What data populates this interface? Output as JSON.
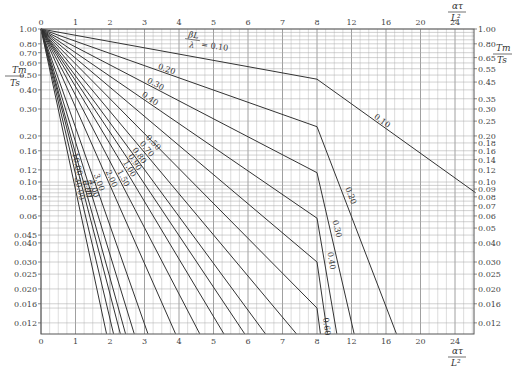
{
  "chart_data": {
    "type": "line",
    "title": "",
    "xlabel": "ατ / L²",
    "ylabel": "T_m / T_s",
    "x_scale": "piecewise-linear",
    "x_ticks": [
      0,
      1,
      2,
      3,
      4,
      5,
      6,
      7,
      8,
      12,
      16,
      20,
      24
    ],
    "x_tick_labels": [
      "0",
      "1",
      "2",
      "3",
      "4",
      "5",
      "6",
      "7",
      "8",
      "12",
      "16",
      "20",
      "24"
    ],
    "y_scale": "log",
    "ylim": [
      0.0102,
      1.0
    ],
    "y_ticks_left": [
      1.0,
      0.8,
      0.7,
      0.6,
      0.5,
      0.4,
      0.3,
      0.2,
      0.16,
      0.12,
      0.1,
      0.08,
      0.06,
      0.045,
      0.04,
      0.03,
      0.025,
      0.02,
      0.016,
      0.012
    ],
    "y_tick_labels_left": [
      "1.00",
      "0.80",
      "0.70",
      "0.60",
      "0.50",
      "0.40",
      "0.30",
      "0.20",
      "0.16",
      "0.12",
      "0.10",
      "0.08",
      "0.06",
      "0.045",
      "0.040",
      "0.030",
      "0.025",
      "0.020",
      "0.016",
      "0.012"
    ],
    "y_ticks_right": [
      1.0,
      0.8,
      0.65,
      0.55,
      0.45,
      0.35,
      0.3,
      0.25,
      0.2,
      0.18,
      0.16,
      0.14,
      0.12,
      0.1,
      0.09,
      0.08,
      0.07,
      0.06,
      0.05,
      0.04,
      0.03,
      0.025,
      0.02,
      0.016,
      0.012
    ],
    "y_tick_labels_right": [
      "1.00",
      "0.80",
      "0.65",
      "0.55",
      "0.45",
      "0.35",
      "0.30",
      "0.25",
      "0.20",
      "0.18",
      "0.16",
      "0.14",
      "0.12",
      "0.10",
      "0.09",
      "0.08",
      "0.07",
      "0.06",
      "0.05",
      "0.040",
      "0.030",
      "0.025",
      "0.020",
      "0.016",
      "0.012"
    ],
    "grid": true,
    "legend": "inline curve labels",
    "parameter_label": "βL/λ",
    "series": [
      {
        "name": "0.10",
        "points": [
          [
            0,
            1.0
          ],
          [
            8,
            0.47
          ],
          [
            26.4,
            0.085
          ]
        ]
      },
      {
        "name": "0.20",
        "points": [
          [
            0,
            1.0
          ],
          [
            8,
            0.23
          ],
          [
            17.2,
            0.0102
          ]
        ]
      },
      {
        "name": "0.30",
        "points": [
          [
            0,
            1.0
          ],
          [
            8,
            0.115
          ],
          [
            12.3,
            0.0102
          ]
        ]
      },
      {
        "name": "0.40",
        "points": [
          [
            0,
            1.0
          ],
          [
            8,
            0.058
          ],
          [
            10.3,
            0.0102
          ]
        ]
      },
      {
        "name": "0.50",
        "points": [
          [
            0,
            1.0
          ],
          [
            8,
            0.03
          ],
          [
            9.2,
            0.0102
          ]
        ]
      },
      {
        "name": "0.60",
        "points": [
          [
            0,
            1.0
          ],
          [
            8,
            0.015
          ],
          [
            8.4,
            0.0102
          ]
        ]
      },
      {
        "name": "0.70",
        "points": [
          [
            0,
            1.0
          ],
          [
            7.4,
            0.0102
          ]
        ]
      },
      {
        "name": "0.80",
        "points": [
          [
            0,
            1.0
          ],
          [
            6.5,
            0.0102
          ]
        ]
      },
      {
        "name": "0.90",
        "points": [
          [
            0,
            1.0
          ],
          [
            5.9,
            0.0102
          ]
        ]
      },
      {
        "name": "1.00",
        "points": [
          [
            0,
            1.0
          ],
          [
            5.3,
            0.0102
          ]
        ]
      },
      {
        "name": "1.50",
        "points": [
          [
            0,
            1.0
          ],
          [
            4.6,
            0.0102
          ]
        ]
      },
      {
        "name": "2.00",
        "points": [
          [
            0,
            1.0
          ],
          [
            3.9,
            0.0102
          ]
        ]
      },
      {
        "name": "3.00",
        "points": [
          [
            0,
            1.0
          ],
          [
            3.1,
            0.0102
          ]
        ]
      },
      {
        "name": "4.00",
        "points": [
          [
            0,
            1.0
          ],
          [
            2.7,
            0.0102
          ]
        ]
      },
      {
        "name": "5.00",
        "points": [
          [
            0,
            1.0
          ],
          [
            2.45,
            0.0102
          ]
        ]
      },
      {
        "name": "6.00",
        "points": [
          [
            0,
            1.0
          ],
          [
            2.3,
            0.0102
          ]
        ]
      },
      {
        "name": "10.00",
        "points": [
          [
            0,
            1.0
          ],
          [
            2.1,
            0.0102
          ]
        ]
      },
      {
        "name": "30.00",
        "points": [
          [
            0,
            1.0
          ],
          [
            1.9,
            0.0102
          ]
        ]
      }
    ],
    "annotations": [
      "βL/λ = 0.10"
    ]
  },
  "labels": {
    "x_axis_title_num": "ατ",
    "x_axis_title_den": "L²",
    "y_axis_title_num": "Tm",
    "y_axis_title_den": "Ts",
    "param_num": "βL",
    "param_den": "λ",
    "param_value": "= 0.10"
  }
}
